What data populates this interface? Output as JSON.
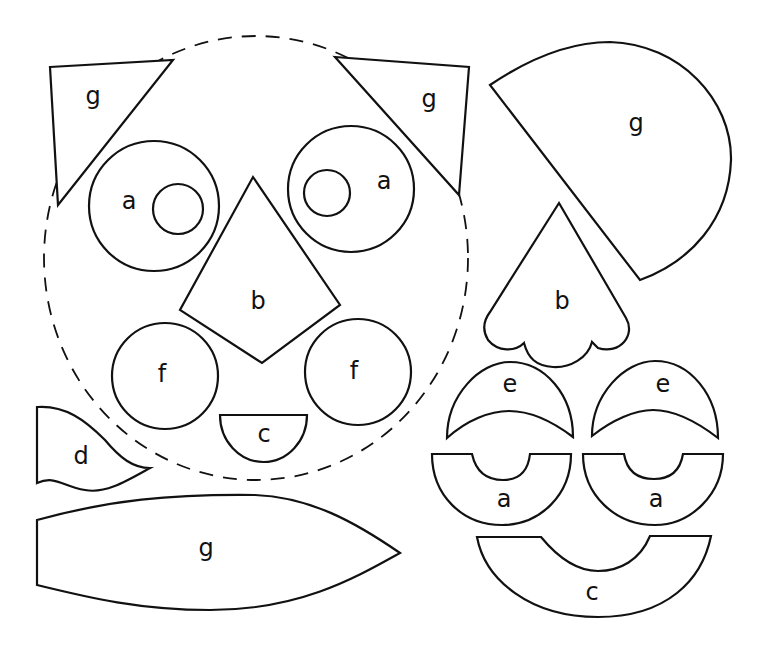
{
  "diagram": {
    "kind": "paper-craft face template pieces",
    "colors": {
      "line": "#111111",
      "background": "#ffffff"
    },
    "guide": {
      "name": "face-outline",
      "style": "dashed circle"
    },
    "labels": {
      "ear_left": "g",
      "ear_right": "g",
      "eye_left": "a",
      "eye_right": "a",
      "nose": "b",
      "cheek_left": "f",
      "cheek_right": "f",
      "mouth": "c",
      "piece_d": "d",
      "long_leaf": "g",
      "big_sector": "g",
      "scallop_nose": "b",
      "crescent_left": "e",
      "crescent_right": "e",
      "arc_left": "a",
      "arc_right": "a",
      "big_arc": "c"
    }
  }
}
